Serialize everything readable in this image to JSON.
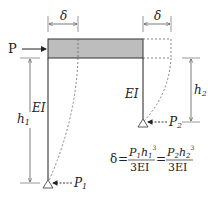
{
  "diagram": {
    "type": "structural-frame",
    "load_label": "P",
    "deflection_label_left": "δ",
    "deflection_label_right": "δ",
    "left_column": {
      "stiffness_label": "EI",
      "height_label": "h",
      "height_sub": "1",
      "reaction_label": "P",
      "reaction_sub": "1"
    },
    "right_column": {
      "stiffness_label": "EI",
      "height_label": "h",
      "height_sub": "2",
      "reaction_label": "P",
      "reaction_sub": "2"
    },
    "formula": {
      "lhs": "δ",
      "eq": "=",
      "frac1": {
        "num_P": "P",
        "num_P_sub": "1",
        "num_h": "h",
        "num_h_sub": "1",
        "num_exp": "3",
        "den": "3EI"
      },
      "frac2": {
        "num_P": "P",
        "num_P_sub": "2",
        "num_h": "h",
        "num_h_sub": "2",
        "num_exp": "3",
        "den": "3EI"
      }
    },
    "colors": {
      "beam_fill": "#bdbdbd",
      "line": "#333333",
      "dashed": "#666666"
    }
  }
}
